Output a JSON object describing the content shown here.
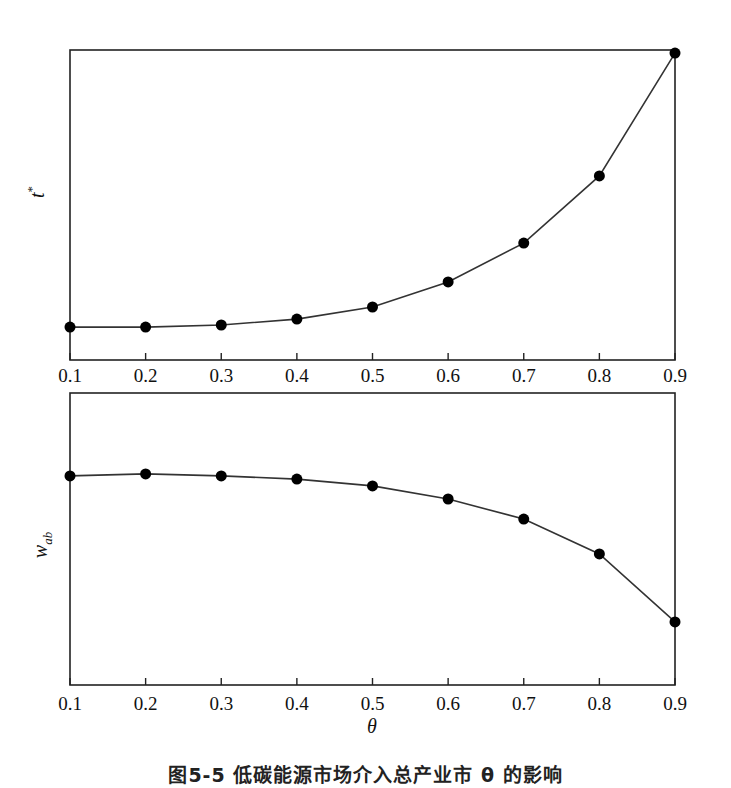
{
  "figure": {
    "caption": "图5-5  低碳能源市场介入总产业市 θ 的影响",
    "xlabel": "θ"
  },
  "chart_data": [
    {
      "type": "line",
      "title": "",
      "xlabel": "",
      "ylabel": "t*",
      "ylabel_main": "t",
      "ylabel_sup": "*",
      "x": [
        0.1,
        0.2,
        0.3,
        0.4,
        0.5,
        0.6,
        0.7,
        0.8,
        0.9
      ],
      "tick_labels": [
        "0.1",
        "0.2",
        "0.3",
        "0.4",
        "0.5",
        "0.6",
        "0.7",
        "0.8",
        "0.9"
      ],
      "values_normalized": [
        0.106,
        0.106,
        0.113,
        0.132,
        0.171,
        0.252,
        0.377,
        0.594,
        0.99
      ],
      "ylim": [
        0,
        1
      ],
      "y_ticks_shown": false,
      "markers": "filled-circle",
      "grid": false,
      "legend": null
    },
    {
      "type": "line",
      "title": "",
      "xlabel": "θ",
      "ylabel": "w_ab",
      "ylabel_main": "w",
      "ylabel_sub": "ab",
      "x": [
        0.1,
        0.2,
        0.3,
        0.4,
        0.5,
        0.6,
        0.7,
        0.8,
        0.9
      ],
      "tick_labels": [
        "0.1",
        "0.2",
        "0.3",
        "0.4",
        "0.5",
        "0.6",
        "0.7",
        "0.8",
        "0.9"
      ],
      "values_normalized": [
        0.716,
        0.723,
        0.716,
        0.705,
        0.682,
        0.637,
        0.568,
        0.449,
        0.216
      ],
      "ylim": [
        0,
        1
      ],
      "y_ticks_shown": false,
      "markers": "filled-circle",
      "grid": false,
      "legend": null
    }
  ],
  "colors": {
    "line": "#333333",
    "marker": "#000000",
    "frame": "#222222"
  }
}
